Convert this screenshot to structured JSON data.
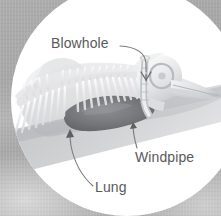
{
  "figure": {
    "style": "grayscale skeletal cutaway in circular vignette",
    "background_color": "#a8a8a8",
    "vignette_color": "#ffffff",
    "label_color": "#5a5a5c",
    "leader_line_color": "#6e6e70",
    "lung_color": "#6f7173",
    "skeleton_color": "#e8e8ea",
    "body_color": "#c9cacc"
  },
  "labels": [
    {
      "id": "blowhole",
      "text": "Blowhole",
      "leader": "curve-right-down",
      "arrow": "chevron-down",
      "points_to": "top of head nasal opening"
    },
    {
      "id": "windpipe",
      "text": "Windpipe",
      "leader": "curve-up-left",
      "arrow": "arrowhead-up",
      "points_to": "trachea below skull"
    },
    {
      "id": "lung",
      "text": "Lung",
      "leader": "curve-up-left",
      "arrow": "arrowhead-up",
      "points_to": "dark lung mass in torso"
    }
  ],
  "anatomy_parts": [
    {
      "id": "skull",
      "name": "skull"
    },
    {
      "id": "rostrum",
      "name": "rostrum"
    },
    {
      "id": "eye-socket",
      "name": "eye socket"
    },
    {
      "id": "spine",
      "name": "vertebral column"
    },
    {
      "id": "ribs",
      "name": "neural spines and ribs"
    },
    {
      "id": "dorsal-fin",
      "name": "dorsal fin"
    },
    {
      "id": "lung-mass",
      "name": "lung"
    },
    {
      "id": "trachea",
      "name": "windpipe"
    },
    {
      "id": "blowhole-opening",
      "name": "blowhole"
    },
    {
      "id": "body-outline",
      "name": "body silhouette"
    }
  ]
}
